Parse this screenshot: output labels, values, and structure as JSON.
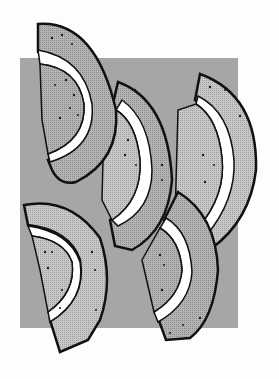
{
  "image": {
    "description": "Clip-art illustration of five melon slices over a gray square",
    "colors": {
      "background": "#fdfdfd",
      "backdrop": "#a6a6a6",
      "flesh_dark": "#9a9a9a",
      "flesh_light": "#bdbdbd",
      "rind": "#ffffff",
      "outline": "#111111",
      "seed": "#1a1a1a"
    },
    "slices": [
      {
        "name": "top-left-slice"
      },
      {
        "name": "center-slice"
      },
      {
        "name": "right-slice"
      },
      {
        "name": "bottom-left-slice"
      },
      {
        "name": "bottom-center-slice"
      }
    ]
  }
}
